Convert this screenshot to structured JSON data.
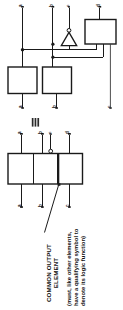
{
  "figure": {
    "kind": "logic-symbol-equivalence-diagram",
    "ink_color": "#1a1a1a",
    "background_color": "#ffffff",
    "equivalence_symbol": "≡"
  },
  "top_diagram": {
    "name": "discrete-element-form",
    "inputs": [
      {
        "id": "in-a",
        "label": "a"
      },
      {
        "id": "in-b",
        "label": "b"
      },
      {
        "id": "in-c",
        "label": "c"
      },
      {
        "id": "in-d",
        "label": "d"
      }
    ],
    "outputs": [
      {
        "id": "out-a",
        "label": "a"
      },
      {
        "id": "out-b",
        "label": "b"
      },
      {
        "id": "out-c",
        "label": "c"
      }
    ],
    "elements": [
      {
        "id": "block-left",
        "type": "rectangular-element"
      },
      {
        "id": "block-middle",
        "type": "rectangular-element"
      },
      {
        "id": "block-right",
        "type": "rectangular-element"
      },
      {
        "id": "inverter",
        "type": "triangle-gate-with-bubble"
      }
    ]
  },
  "bottom_diagram": {
    "name": "merged-common-output-form",
    "inputs": [
      {
        "id": "m-in-a",
        "label": "a"
      },
      {
        "id": "m-in-b",
        "label": "b"
      },
      {
        "id": "m-in-c",
        "label": "c"
      },
      {
        "id": "m-in-d",
        "label": "d"
      }
    ],
    "outputs": [
      {
        "id": "m-out-a",
        "label": "a"
      },
      {
        "id": "m-out-b",
        "label": "b"
      },
      {
        "id": "m-out-c",
        "label": "c"
      }
    ],
    "compartments": [
      {
        "id": "compartment-1"
      },
      {
        "id": "compartment-2"
      },
      {
        "id": "compartment-3",
        "role": "common-output-element"
      }
    ]
  },
  "annotation": {
    "title_line_1": "COMMON OUTPUT",
    "title_line_2": "ELEMENT",
    "note_line_1": "(must, like other elements,",
    "note_line_2": "have a qualifying symbol to",
    "note_line_3": "denote its logic function)"
  }
}
